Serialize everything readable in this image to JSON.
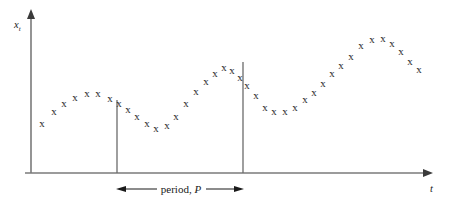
{
  "figure": {
    "title": "",
    "background_color": "#ffffff",
    "width": 450,
    "height": 204
  },
  "axes": {
    "y_label": "x",
    "y_label_subscript": "t",
    "x_label": "t",
    "origin_x": 31,
    "origin_y": 173,
    "y_top": 10,
    "x_right": 432,
    "axis_color": "#7a7a7a"
  },
  "annotation": {
    "period_text_prefix": "period, ",
    "period_text_symbol": "P",
    "period_label": "period, P",
    "left_marker_x": 117,
    "right_marker_x": 243,
    "bar_y": 189,
    "marker_color": "#6b6b6b",
    "text_color": "#1a1a1a"
  },
  "chart_data": {
    "type": "scatter",
    "title": "",
    "xlabel": "t",
    "ylabel": "x_t",
    "marker": "x",
    "marker_color": "#2b2b2b",
    "grid": false,
    "legend": null,
    "xlim": [
      0,
      60
    ],
    "ylim": [
      0,
      10
    ],
    "series": [
      {
        "name": "x_t",
        "points": [
          {
            "x": 42,
            "y": 124
          },
          {
            "x": 54,
            "y": 112
          },
          {
            "x": 64,
            "y": 104
          },
          {
            "x": 75,
            "y": 98
          },
          {
            "x": 87,
            "y": 94
          },
          {
            "x": 98,
            "y": 94
          },
          {
            "x": 110,
            "y": 99
          },
          {
            "x": 119,
            "y": 104
          },
          {
            "x": 128,
            "y": 110
          },
          {
            "x": 137,
            "y": 117
          },
          {
            "x": 147,
            "y": 124
          },
          {
            "x": 156,
            "y": 129
          },
          {
            "x": 167,
            "y": 126
          },
          {
            "x": 176,
            "y": 117
          },
          {
            "x": 186,
            "y": 104
          },
          {
            "x": 196,
            "y": 92
          },
          {
            "x": 206,
            "y": 82
          },
          {
            "x": 215,
            "y": 74
          },
          {
            "x": 224,
            "y": 68
          },
          {
            "x": 232,
            "y": 71
          },
          {
            "x": 240,
            "y": 78
          },
          {
            "x": 247,
            "y": 86
          },
          {
            "x": 256,
            "y": 96
          },
          {
            "x": 265,
            "y": 108
          },
          {
            "x": 274,
            "y": 112
          },
          {
            "x": 285,
            "y": 112
          },
          {
            "x": 295,
            "y": 108
          },
          {
            "x": 305,
            "y": 100
          },
          {
            "x": 314,
            "y": 93
          },
          {
            "x": 323,
            "y": 84
          },
          {
            "x": 332,
            "y": 74
          },
          {
            "x": 341,
            "y": 66
          },
          {
            "x": 351,
            "y": 57
          },
          {
            "x": 361,
            "y": 46
          },
          {
            "x": 372,
            "y": 40
          },
          {
            "x": 383,
            "y": 39
          },
          {
            "x": 392,
            "y": 44
          },
          {
            "x": 401,
            "y": 52
          },
          {
            "x": 410,
            "y": 62
          },
          {
            "x": 419,
            "y": 70
          }
        ]
      }
    ]
  }
}
